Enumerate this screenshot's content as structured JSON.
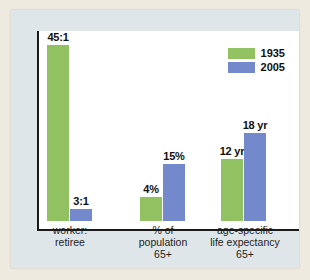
{
  "colors": {
    "series_1935": "#92c162",
    "series_2005": "#7389cc",
    "outer_background": "#eeeadf",
    "panel_background": "#dfe6ea",
    "plot_background": "#ffffff",
    "axis": "#1a1a1a",
    "text": "#111111"
  },
  "legend": {
    "position": "top-right",
    "entries": [
      {
        "label": "1935",
        "color": "#92c162"
      },
      {
        "label": "2005",
        "color": "#7389cc"
      }
    ]
  },
  "chart_data": {
    "type": "bar",
    "title": "",
    "subtitle": "",
    "xlabel": "",
    "ylabel": "",
    "grid": false,
    "legend_position": "top-right",
    "note": "Grouped bar chart; each category group uses its own independent scale, bar heights are illustrative rather than a shared numeric axis.",
    "categories": [
      "worker:\nretiree",
      "% of\npopulation\n65+",
      "age-specific\nlife expectancy\n65+"
    ],
    "category_lines": [
      [
        "worker:",
        "retiree"
      ],
      [
        "% of",
        "population",
        "65+"
      ],
      [
        "age-specific",
        "life expectancy",
        "65+"
      ]
    ],
    "series": [
      {
        "name": "1935",
        "color": "#92c162",
        "values": [
          45,
          4,
          12
        ],
        "value_labels": [
          "45:1",
          "4%",
          "12 yr"
        ],
        "bar_heights_px": [
          176,
          24,
          62
        ]
      },
      {
        "name": "2005",
        "color": "#7389cc",
        "values": [
          3,
          15,
          18
        ],
        "value_labels": [
          "3:1",
          "15%",
          "18 yr"
        ],
        "bar_heights_px": [
          12,
          57,
          88
        ]
      }
    ],
    "points": [
      {
        "category": "worker:retiree",
        "series": "1935",
        "label": "45:1",
        "value": 45
      },
      {
        "category": "worker:retiree",
        "series": "2005",
        "label": "3:1",
        "value": 3
      },
      {
        "category": "% of population 65+",
        "series": "1935",
        "label": "4%",
        "value": 4
      },
      {
        "category": "% of population 65+",
        "series": "2005",
        "label": "15%",
        "value": 15
      },
      {
        "category": "age-specific life expectancy 65+",
        "series": "1935",
        "label": "12 yr",
        "value": 12
      },
      {
        "category": "age-specific life expectancy 65+",
        "series": "2005",
        "label": "18 yr",
        "value": 18
      }
    ]
  }
}
